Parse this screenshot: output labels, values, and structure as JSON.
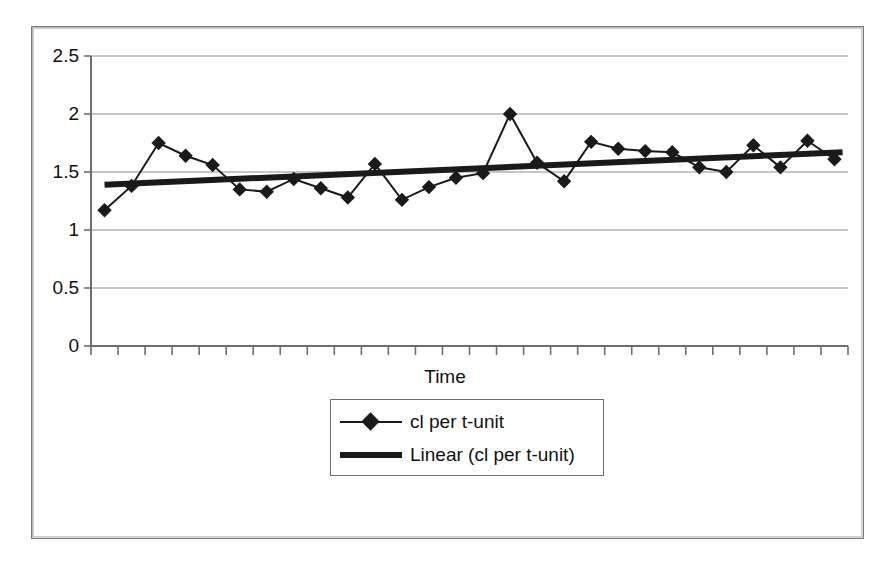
{
  "figure": {
    "frame": {
      "x": 31,
      "y": 26,
      "width": 831,
      "height": 511
    }
  },
  "chart_data": {
    "type": "line",
    "title": "",
    "subtitle": "",
    "xlabel": "Time",
    "ylabel": "",
    "ylim": [
      0,
      2.5
    ],
    "y_ticks": [
      0,
      0.5,
      1,
      1.5,
      2,
      2.5
    ],
    "y_tick_labels": [
      "0",
      "0.5",
      "1",
      "1.5",
      "2",
      "2.5"
    ],
    "x_ticks_count": 28,
    "x_tick_labels": [],
    "grid": "horizontal",
    "legend_position": "below-axis-center",
    "legend": [
      "cl per t-unit",
      "Linear (cl per t-unit)"
    ],
    "series": [
      {
        "name": "cl per t-unit",
        "type": "line-marker",
        "marker": "diamond",
        "color": "#1a1a1a",
        "x": [
          1,
          2,
          3,
          4,
          5,
          6,
          7,
          8,
          9,
          10,
          11,
          12,
          13,
          14,
          15,
          16,
          17,
          18,
          19,
          20,
          21,
          22,
          23,
          24,
          25,
          26,
          27,
          28
        ],
        "values": [
          1.17,
          1.38,
          1.75,
          1.64,
          1.56,
          1.35,
          1.33,
          1.44,
          1.36,
          1.28,
          1.57,
          1.26,
          1.37,
          1.45,
          1.49,
          2.0,
          1.58,
          1.42,
          1.76,
          1.7,
          1.68,
          1.67,
          1.54,
          1.5,
          1.73,
          1.54,
          1.77,
          1.61
        ]
      },
      {
        "name": "Linear (cl per t-unit)",
        "type": "trendline",
        "color": "#1a1a1a",
        "x": [
          1,
          28
        ],
        "values": [
          1.39,
          1.67
        ]
      }
    ]
  },
  "axis": {
    "y_labels": [
      {
        "text": "2.5",
        "value": 2.5
      },
      {
        "text": "2",
        "value": 2.0
      },
      {
        "text": "1.5",
        "value": 1.5
      },
      {
        "text": "1",
        "value": 1.0
      },
      {
        "text": "0.5",
        "value": 0.5
      },
      {
        "text": "0",
        "value": 0.0
      }
    ],
    "x_title": "Time"
  },
  "legend": {
    "items": [
      {
        "label": "cl per t-unit",
        "style": "line-with-diamond"
      },
      {
        "label": "Linear (cl per t-unit)",
        "style": "thick-line"
      }
    ]
  },
  "colors": {
    "series": "#1a1a1a",
    "gridline": "#8e8e8e",
    "axis": "#6e6e6e",
    "frame": "#7b7b7b",
    "background": "#ffffff"
  }
}
